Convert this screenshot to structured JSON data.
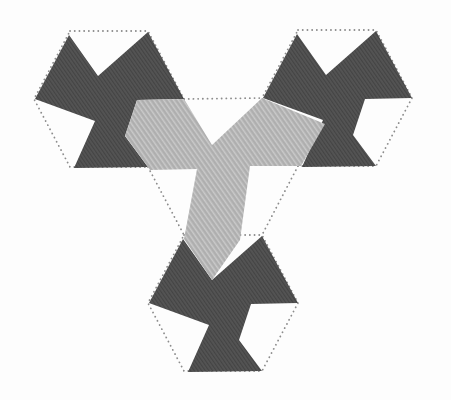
{
  "figure": {
    "canvas": {
      "width": 451,
      "height": 400,
      "background": "#fdfdfd"
    },
    "colors": {
      "dark_fill": "#4e4e4e",
      "dark_stripe_shadow": "rgba(0,0,0,0.14)",
      "dark_stripe_light": "rgba(255,255,255,0.07)",
      "light_fill": "#b3b3b3",
      "light_stripe": "rgba(255,255,255,0.30)",
      "light_stripe_shadow": "rgba(0,0,0,0.05)",
      "dot_color": "#8c8c8c"
    },
    "dot_style": {
      "stroke_width": 1.8,
      "dash": "0.1 4.6"
    },
    "hexagon_base": [
      [
        70,
        31
      ],
      [
        148,
        31
      ],
      [
        184,
        99
      ],
      [
        148,
        167
      ],
      [
        70,
        167
      ],
      [
        34,
        99
      ]
    ],
    "motif_base": [
      [
        69,
        35
      ],
      [
        98,
        76
      ],
      [
        148,
        32
      ],
      [
        184,
        99
      ],
      [
        137,
        100
      ],
      [
        125,
        136
      ],
      [
        148,
        167
      ],
      [
        74,
        168
      ],
      [
        95,
        121
      ],
      [
        35,
        99
      ]
    ],
    "translations": [
      [
        0,
        0
      ],
      [
        228,
        -1
      ],
      [
        114,
        204
      ]
    ],
    "connectors": [
      [
        [
          184,
          99
        ],
        [
          262,
          98
        ]
      ],
      [
        [
          148,
          167
        ],
        [
          184,
          235
        ]
      ],
      [
        [
          298,
          166
        ],
        [
          262,
          235
        ]
      ]
    ],
    "y_shape": [
      [
        137,
        100
      ],
      [
        184,
        99
      ],
      [
        212,
        145
      ],
      [
        262,
        98
      ],
      [
        325,
        124
      ],
      [
        301,
        166
      ],
      [
        250,
        166
      ],
      [
        240,
        240
      ],
      [
        212,
        280
      ],
      [
        184,
        239
      ],
      [
        197,
        169
      ],
      [
        150,
        170
      ],
      [
        125,
        136
      ]
    ]
  }
}
